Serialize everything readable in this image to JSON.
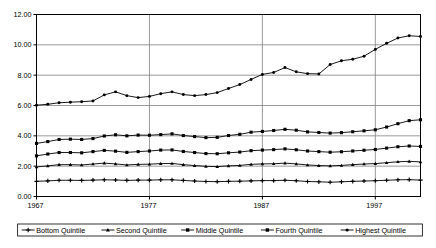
{
  "chart_data": {
    "type": "line",
    "title": "",
    "subtitle": "",
    "xlabel": "",
    "ylabel": "",
    "xlim": [
      1967,
      2001
    ],
    "ylim": [
      0.0,
      12.0
    ],
    "grid": true,
    "legend_position": "bottom",
    "ytick_labels": [
      "0.00",
      "2.00",
      "4.00",
      "6.00",
      "8.00",
      "10.00",
      "12.00"
    ],
    "ytick_values": [
      0.0,
      2.0,
      4.0,
      6.0,
      8.0,
      10.0,
      12.0
    ],
    "xtick_labels": [
      "1967",
      "1977",
      "1987",
      "1997"
    ],
    "xtick_values": [
      1967,
      1977,
      1987,
      1997
    ],
    "x": [
      1967,
      1968,
      1969,
      1970,
      1971,
      1972,
      1973,
      1974,
      1975,
      1976,
      1977,
      1978,
      1979,
      1980,
      1981,
      1982,
      1983,
      1984,
      1985,
      1986,
      1987,
      1988,
      1989,
      1990,
      1991,
      1992,
      1993,
      1994,
      1995,
      1996,
      1997,
      1998,
      1999,
      2000,
      2001
    ],
    "series": [
      {
        "name": "Bottom Quintile",
        "marker": "plus",
        "color": "#000000",
        "values": [
          1.0,
          1.03,
          1.07,
          1.07,
          1.06,
          1.08,
          1.1,
          1.09,
          1.06,
          1.08,
          1.08,
          1.1,
          1.1,
          1.06,
          1.02,
          0.99,
          0.98,
          1.0,
          1.01,
          1.03,
          1.05,
          1.05,
          1.07,
          1.04,
          0.99,
          0.97,
          0.94,
          0.97,
          1.0,
          1.02,
          1.04,
          1.07,
          1.1,
          1.11,
          1.08
        ]
      },
      {
        "name": "Second Quintile",
        "marker": "triangle",
        "color": "#000000",
        "values": [
          1.95,
          2.02,
          2.1,
          2.1,
          2.08,
          2.14,
          2.2,
          2.15,
          2.08,
          2.12,
          2.13,
          2.17,
          2.18,
          2.1,
          2.04,
          1.99,
          1.97,
          2.02,
          2.05,
          2.12,
          2.15,
          2.16,
          2.2,
          2.15,
          2.08,
          2.04,
          2.02,
          2.05,
          2.1,
          2.14,
          2.17,
          2.23,
          2.29,
          2.32,
          2.28
        ]
      },
      {
        "name": "Middle Quintile",
        "marker": "square",
        "color": "#000000",
        "values": [
          2.68,
          2.8,
          2.9,
          2.9,
          2.88,
          2.96,
          3.04,
          2.99,
          2.91,
          2.96,
          3.0,
          3.06,
          3.07,
          2.97,
          2.9,
          2.83,
          2.82,
          2.88,
          2.93,
          3.02,
          3.06,
          3.09,
          3.14,
          3.08,
          3.0,
          2.96,
          2.92,
          2.95,
          3.0,
          3.05,
          3.1,
          3.19,
          3.28,
          3.33,
          3.3
        ]
      },
      {
        "name": "Fourth Quintile",
        "marker": "square",
        "color": "#000000",
        "values": [
          3.5,
          3.62,
          3.76,
          3.78,
          3.76,
          3.82,
          3.99,
          4.07,
          4.0,
          4.05,
          4.04,
          4.08,
          4.13,
          4.02,
          3.95,
          3.88,
          3.9,
          4.02,
          4.1,
          4.24,
          4.29,
          4.35,
          4.43,
          4.37,
          4.26,
          4.22,
          4.18,
          4.21,
          4.27,
          4.33,
          4.4,
          4.58,
          4.8,
          5.0,
          5.06
        ]
      },
      {
        "name": "Highest Quintile",
        "marker": "circle",
        "color": "#000000",
        "values": [
          6.02,
          6.08,
          6.18,
          6.22,
          6.25,
          6.3,
          6.7,
          6.9,
          6.65,
          6.52,
          6.6,
          6.78,
          6.9,
          6.72,
          6.65,
          6.72,
          6.85,
          7.12,
          7.38,
          7.72,
          8.05,
          8.18,
          8.5,
          8.22,
          8.1,
          8.08,
          8.7,
          8.95,
          9.05,
          9.25,
          9.7,
          10.1,
          10.45,
          10.6,
          10.55
        ]
      }
    ]
  },
  "legend": {
    "items": [
      {
        "label": "Bottom Quintile",
        "marker": "plus"
      },
      {
        "label": "Second Quintile",
        "marker": "triangle"
      },
      {
        "label": "Middle Quintile",
        "marker": "square"
      },
      {
        "label": "Fourth Quintile",
        "marker": "square"
      },
      {
        "label": "Highest Quintile",
        "marker": "circle"
      }
    ]
  },
  "colors": {
    "plot_border": "#000000",
    "gridline": "#808080",
    "series": "#000000",
    "background": "#ffffff",
    "text": "#000000"
  }
}
